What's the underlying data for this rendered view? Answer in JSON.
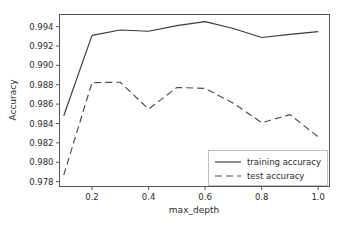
{
  "chart_data": {
    "type": "line",
    "title": "",
    "xlabel": "max_depth",
    "ylabel": "Accuracy",
    "xlim": [
      0.085,
      1.04
    ],
    "ylim": [
      0.9775,
      0.99525
    ],
    "xticks": [
      0.2,
      0.4,
      0.6,
      0.8,
      1.0
    ],
    "xticklabels": [
      "0.2",
      "0.4",
      "0.6",
      "0.8",
      "1.0"
    ],
    "yticks": [
      0.978,
      0.98,
      0.982,
      0.984,
      0.986,
      0.988,
      0.99,
      0.992,
      0.994
    ],
    "yticklabels": [
      "0.978",
      "0.980",
      "0.982",
      "0.984",
      "0.986",
      "0.988",
      "0.990",
      "0.992",
      "0.994"
    ],
    "grid": false,
    "legend_position": "lower right",
    "x": [
      0.1,
      0.2,
      0.3,
      0.4,
      0.5,
      0.6,
      0.7,
      0.8,
      0.9,
      1.0
    ],
    "series": [
      {
        "name": "training accuracy",
        "style": "solid",
        "color": "#3a3a3a",
        "values": [
          0.9848,
          0.9931,
          0.99365,
          0.99352,
          0.9941,
          0.99452,
          0.9938,
          0.99288,
          0.9932,
          0.99348
        ]
      },
      {
        "name": "test accuracy",
        "style": "dashed",
        "color": "#4a4a4a",
        "values": [
          0.97868,
          0.98822,
          0.98826,
          0.98548,
          0.98772,
          0.98762,
          0.9861,
          0.98408,
          0.98492,
          0.98262
        ]
      }
    ]
  },
  "legend": {
    "entries": [
      {
        "label": "training accuracy",
        "style": "solid"
      },
      {
        "label": "test accuracy",
        "style": "dashed"
      }
    ]
  },
  "colors": {
    "background": "#ffffff",
    "axis": "#555555",
    "text": "#2b2b2b",
    "training_line": "#3a3a3a",
    "test_line": "#4a4a4a"
  }
}
